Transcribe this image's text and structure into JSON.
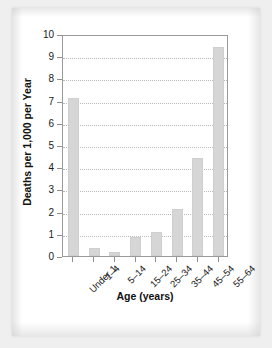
{
  "chart_data": {
    "type": "bar",
    "title": "",
    "subtitle": "",
    "xlabel": "Age (years)",
    "ylabel": "Deaths per 1,000 per Year",
    "categories": [
      "Under 1",
      "1–4",
      "5–14",
      "15–24",
      "25–34",
      "35–44",
      "45–54",
      "55–64"
    ],
    "values": [
      7.1,
      0.35,
      0.18,
      0.85,
      1.1,
      2.1,
      4.4,
      9.4
    ],
    "ylim": [
      0,
      10
    ],
    "yticks": [
      0,
      1,
      2,
      3,
      4,
      5,
      6,
      7,
      8,
      9,
      10
    ],
    "ytick_labels": [
      "0",
      "1",
      "2",
      "3",
      "4",
      "5",
      "6",
      "7",
      "8",
      "9",
      "10"
    ],
    "grid": true,
    "grid_axis": "y",
    "legend": false,
    "legend_position": "none",
    "bar_color": "#d6d6d6",
    "axis_color": "#9a9a9a",
    "grid_color": "#b9b9b9",
    "text_color": "#1a1a1a",
    "xtick_label_rotation": -45
  }
}
